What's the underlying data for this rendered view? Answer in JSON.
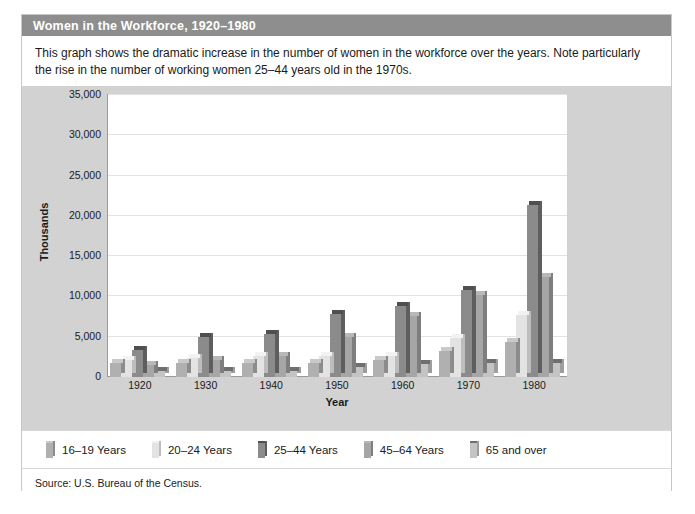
{
  "figure": {
    "title": "Women in the Workforce, 1920–1980",
    "description": "This graph shows the dramatic increase in the number of women in the workforce over the years. Note particularly the rise in the number of working women 25–44 years old in the 1970s.",
    "source": "Source: U.S. Bureau of the Census."
  },
  "colors": {
    "title_bar": "#8e8e8e",
    "panel_background": "#d2d2d2",
    "plot_background": "#ffffff",
    "gridline": "#e2e2e2",
    "axis": "#9a9a9a",
    "frame_border": "#c8c8c8"
  },
  "chart_data": {
    "type": "bar",
    "title": "Women in the Workforce, 1920–1980",
    "xlabel": "Year",
    "ylabel": "Thousands",
    "ylim": [
      0,
      35000
    ],
    "ytick_labels": [
      "0",
      "5,000",
      "10,000",
      "15,000",
      "20,000",
      "25,000",
      "30,000",
      "35,000"
    ],
    "ytick_values": [
      0,
      5000,
      10000,
      15000,
      20000,
      25000,
      30000,
      35000
    ],
    "grid": true,
    "legend_position": "below",
    "categories": [
      "1920",
      "1930",
      "1940",
      "1950",
      "1960",
      "1970",
      "1980"
    ],
    "series": [
      {
        "name": "16–19 Years",
        "color": "#b0b0b0",
        "side_color": "#8c8c8c",
        "top_color": "#c9c9c9",
        "values": [
          1800,
          1800,
          1800,
          1700,
          2100,
          3200,
          4400
        ]
      },
      {
        "name": "20–24 Years",
        "color": "#e3e3e3",
        "side_color": "#bdbdbd",
        "top_color": "#f2f2f2",
        "values": [
          2100,
          2300,
          2600,
          2600,
          2600,
          4900,
          7700
        ]
      },
      {
        "name": "25–44 Years",
        "color": "#8b8b8b",
        "side_color": "#5e5e5e",
        "top_color": "#4f4f4f",
        "values": [
          3400,
          5000,
          5400,
          7800,
          8800,
          10800,
          21300
        ]
      },
      {
        "name": "45–64 Years",
        "color": "#a6a6a6",
        "side_color": "#7e7e7e",
        "top_color": "#b8b8b8",
        "values": [
          1500,
          2100,
          2600,
          5000,
          7600,
          10200,
          12400
        ]
      },
      {
        "name": "65 and over",
        "color": "#c4c4c4",
        "side_color": "#9d9d9d",
        "top_color": "#6f6f6f",
        "values": [
          700,
          800,
          800,
          1300,
          1600,
          1700,
          1800
        ]
      }
    ]
  }
}
